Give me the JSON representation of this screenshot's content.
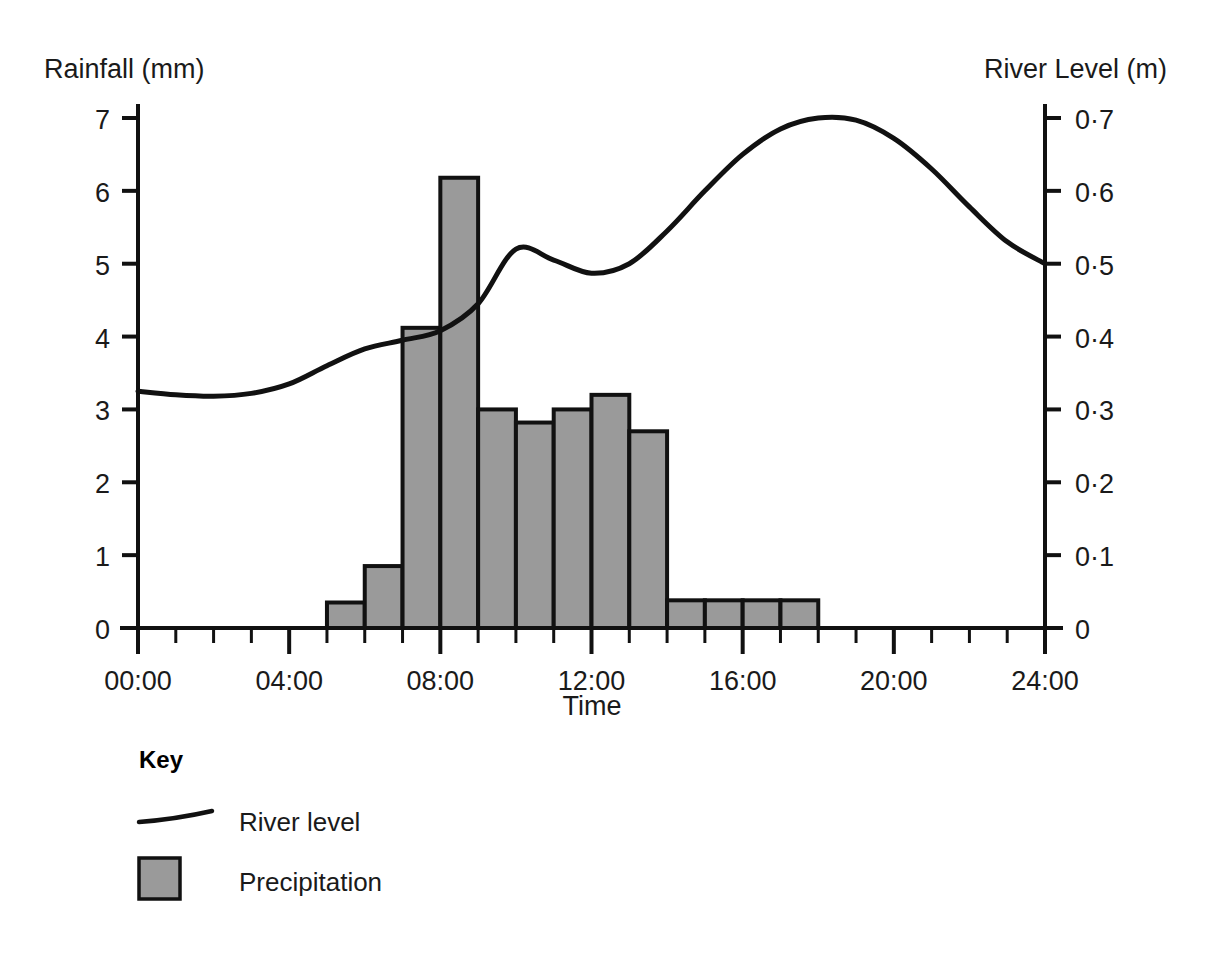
{
  "chart_data": {
    "type": "bar",
    "title": "",
    "subtitle": "",
    "xlabel": "Time",
    "ylabel": "Rainfall (mm)",
    "y2label": "River Level (m)",
    "grid": false,
    "legend_position": "below-left",
    "xlim": [
      0,
      24
    ],
    "ylim": [
      0,
      7
    ],
    "y2lim": [
      0,
      0.7
    ],
    "x_tick_labels": [
      "00:00",
      "04:00",
      "08:00",
      "12:00",
      "16:00",
      "20:00",
      "24:00"
    ],
    "x_tick_values": [
      0,
      4,
      8,
      12,
      16,
      20,
      24
    ],
    "x_minor_tick_step_hours": 1,
    "y_tick_labels": [
      "0",
      "1",
      "2",
      "3",
      "4",
      "5",
      "6",
      "7"
    ],
    "y_tick_values": [
      0,
      1,
      2,
      3,
      4,
      5,
      6,
      7
    ],
    "y2_tick_labels": [
      "0",
      "0·1",
      "0·2",
      "0·3",
      "0·4",
      "0·5",
      "0·6",
      "0·7"
    ],
    "y2_tick_values": [
      0,
      0.1,
      0.2,
      0.3,
      0.4,
      0.5,
      0.6,
      0.7
    ],
    "series": [
      {
        "name": "Precipitation",
        "type": "bar",
        "unit": "mm",
        "axis": "left",
        "color": "#9a9a9a",
        "bars": [
          {
            "start_hour": 5,
            "end_hour": 6,
            "value": 0.35
          },
          {
            "start_hour": 6,
            "end_hour": 7,
            "value": 0.85
          },
          {
            "start_hour": 7,
            "end_hour": 8,
            "value": 4.12
          },
          {
            "start_hour": 8,
            "end_hour": 9,
            "value": 6.18
          },
          {
            "start_hour": 9,
            "end_hour": 10,
            "value": 3.0
          },
          {
            "start_hour": 10,
            "end_hour": 11,
            "value": 2.82
          },
          {
            "start_hour": 11,
            "end_hour": 12,
            "value": 3.0
          },
          {
            "start_hour": 12,
            "end_hour": 13,
            "value": 3.2
          },
          {
            "start_hour": 13,
            "end_hour": 14,
            "value": 2.7
          },
          {
            "start_hour": 14,
            "end_hour": 15,
            "value": 0.38
          },
          {
            "start_hour": 15,
            "end_hour": 16,
            "value": 0.38
          },
          {
            "start_hour": 16,
            "end_hour": 17,
            "value": 0.38
          },
          {
            "start_hour": 17,
            "end_hour": 18,
            "value": 0.38
          }
        ]
      },
      {
        "name": "River level",
        "type": "line",
        "unit": "m",
        "axis": "right",
        "color": "#111111",
        "x": [
          0,
          1,
          2,
          3,
          4,
          5,
          6,
          7,
          8,
          9,
          10,
          11,
          12,
          13,
          14,
          15,
          16,
          17,
          18,
          19,
          20,
          21,
          22,
          23,
          24
        ],
        "values": [
          0.325,
          0.32,
          0.318,
          0.322,
          0.335,
          0.36,
          0.383,
          0.395,
          0.408,
          0.445,
          0.52,
          0.505,
          0.487,
          0.5,
          0.545,
          0.6,
          0.65,
          0.685,
          0.7,
          0.697,
          0.672,
          0.63,
          0.578,
          0.53,
          0.5
        ]
      }
    ]
  },
  "labels": {
    "y_axis_title": "Rainfall (mm)",
    "y2_axis_title": "River Level (m)",
    "x_axis_title": "Time"
  },
  "key": {
    "heading": "Key",
    "items": [
      {
        "label": "River level",
        "marker": "line",
        "color": "#111111"
      },
      {
        "label": "Precipitation",
        "marker": "swatch",
        "color": "#9a9a9a"
      }
    ]
  }
}
